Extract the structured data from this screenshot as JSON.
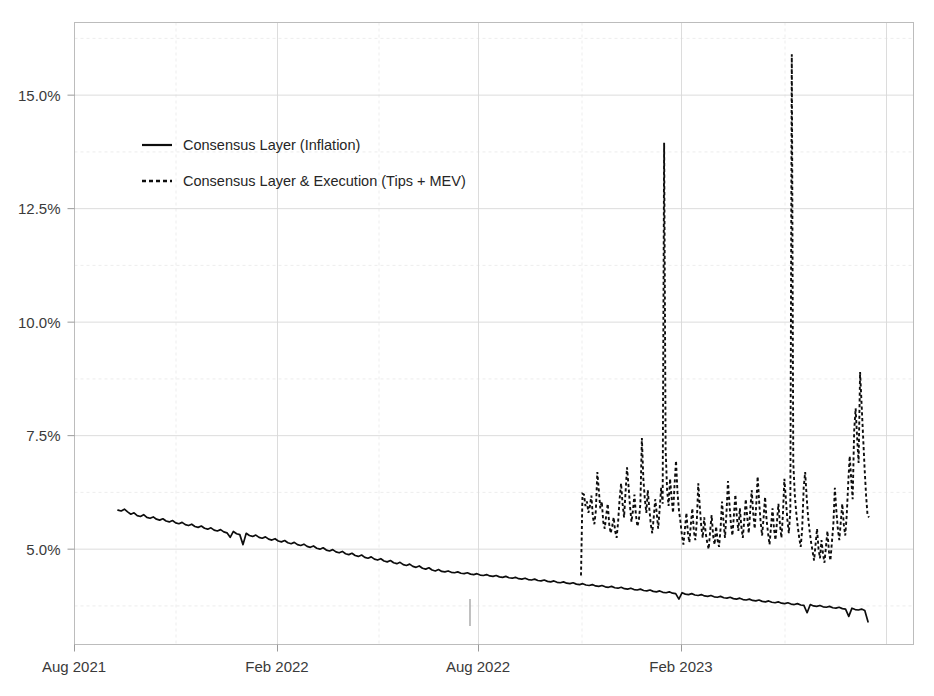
{
  "chart_data": {
    "type": "line",
    "title": "",
    "subtitle": "",
    "xlabel": "",
    "ylabel": "",
    "grid": true,
    "legend_position": "top-left-inside",
    "y_tick_labels": [
      "15.0%",
      "12.5%",
      "10.0%",
      "7.5%",
      "5.0%"
    ],
    "y_tick_values": [
      15.0,
      12.5,
      10.0,
      7.5,
      5.0
    ],
    "ylim": [
      2.9,
      16.6
    ],
    "y_unit": "%",
    "x_tick_labels": [
      "Aug 2021",
      "Feb 2022",
      "Aug 2022",
      "Feb 2023"
    ],
    "x_tick_values": [
      "2021-08",
      "2022-02",
      "2022-08",
      "2023-02"
    ],
    "xlim": [
      "2021-08-01",
      "2023-05-20"
    ],
    "series": [
      {
        "name": "Consensus Layer (Inflation)",
        "style": "solid",
        "color": "#0d0d0d",
        "x_start": "2021-09-01",
        "x_end": "2023-04-25",
        "values": [
          5.86,
          5.84,
          5.88,
          5.82,
          5.77,
          5.8,
          5.74,
          5.72,
          5.76,
          5.7,
          5.68,
          5.71,
          5.66,
          5.64,
          5.67,
          5.62,
          5.6,
          5.63,
          5.58,
          5.56,
          5.59,
          5.54,
          5.52,
          5.55,
          5.5,
          5.48,
          5.51,
          5.46,
          5.44,
          5.47,
          5.42,
          5.4,
          5.43,
          5.38,
          5.36,
          5.26,
          5.39,
          5.34,
          5.32,
          5.1,
          5.35,
          5.3,
          5.28,
          5.31,
          5.26,
          5.24,
          5.27,
          5.22,
          5.2,
          5.23,
          5.18,
          5.16,
          5.19,
          5.14,
          5.12,
          5.15,
          5.1,
          5.08,
          5.11,
          5.06,
          5.04,
          5.07,
          5.02,
          5.0,
          5.03,
          4.98,
          4.96,
          4.99,
          4.94,
          4.92,
          4.95,
          4.9,
          4.88,
          4.91,
          4.86,
          4.84,
          4.87,
          4.82,
          4.8,
          4.83,
          4.78,
          4.76,
          4.79,
          4.74,
          4.72,
          4.75,
          4.7,
          4.68,
          4.71,
          4.66,
          4.64,
          4.67,
          4.62,
          4.6,
          4.63,
          4.58,
          4.56,
          4.59,
          4.54,
          4.52,
          4.55,
          4.51,
          4.5,
          4.52,
          4.49,
          4.48,
          4.5,
          4.47,
          4.46,
          4.48,
          4.45,
          4.44,
          4.46,
          4.43,
          4.42,
          4.44,
          4.41,
          4.4,
          4.42,
          4.39,
          4.38,
          4.4,
          4.37,
          4.36,
          4.38,
          4.35,
          4.34,
          4.36,
          4.33,
          4.32,
          4.34,
          4.31,
          4.3,
          4.32,
          4.29,
          4.28,
          4.3,
          4.27,
          4.26,
          4.28,
          4.25,
          4.24,
          4.26,
          4.23,
          4.22,
          4.24,
          4.21,
          4.2,
          4.22,
          4.19,
          4.18,
          4.2,
          4.17,
          4.16,
          4.18,
          4.15,
          4.14,
          4.16,
          4.13,
          4.12,
          4.14,
          4.11,
          4.1,
          4.12,
          4.09,
          4.08,
          4.1,
          4.07,
          4.06,
          4.08,
          4.05,
          4.04,
          4.06,
          4.03,
          4.02,
          3.9,
          4.04,
          4.01,
          4.0,
          4.02,
          3.99,
          3.98,
          4.0,
          3.97,
          3.96,
          3.98,
          3.95,
          3.94,
          3.96,
          3.93,
          3.92,
          3.94,
          3.91,
          3.9,
          3.92,
          3.89,
          3.88,
          3.9,
          3.87,
          3.86,
          3.88,
          3.85,
          3.84,
          3.86,
          3.83,
          3.82,
          3.84,
          3.81,
          3.8,
          3.82,
          3.79,
          3.78,
          3.8,
          3.77,
          3.76,
          3.6,
          3.78,
          3.75,
          3.74,
          3.76,
          3.73,
          3.72,
          3.74,
          3.71,
          3.7,
          3.72,
          3.69,
          3.68,
          3.52,
          3.7,
          3.67,
          3.66,
          3.68,
          3.65,
          3.4
        ]
      },
      {
        "name": "Consensus Layer & Execution (Tips + MEV)",
        "style": "dashed",
        "color": "#0d0d0d",
        "x_start": "2022-09-15",
        "x_end": "2023-04-26",
        "note": "starts with a vertical jump from the solid series at The Merge",
        "values": [
          4.42,
          6.22,
          6.2,
          5.95,
          6.05,
          5.8,
          5.95,
          6.18,
          5.7,
          5.55,
          5.85,
          6.7,
          6.3,
          5.9,
          6.05,
          5.6,
          5.45,
          5.75,
          6.0,
          5.55,
          5.35,
          5.5,
          5.7,
          5.4,
          5.25,
          5.6,
          6.1,
          6.45,
          6.0,
          5.7,
          6.25,
          6.8,
          6.4,
          5.95,
          5.6,
          5.85,
          6.2,
          5.75,
          5.5,
          5.65,
          6.0,
          7.45,
          6.55,
          6.1,
          5.8,
          6.3,
          5.9,
          5.55,
          5.35,
          5.7,
          6.1,
          5.8,
          5.45,
          5.9,
          6.35,
          6.0,
          13.95,
          7.2,
          6.3,
          5.95,
          6.55,
          6.15,
          5.8,
          6.4,
          6.95,
          6.25,
          5.85,
          5.6,
          5.3,
          5.1,
          5.45,
          5.8,
          5.35,
          5.15,
          5.55,
          5.9,
          5.4,
          5.2,
          5.6,
          6.45,
          5.95,
          5.5,
          5.25,
          5.7,
          5.35,
          5.15,
          5.0,
          5.4,
          5.75,
          5.3,
          5.1,
          5.5,
          5.2,
          5.05,
          5.45,
          6.05,
          5.6,
          5.25,
          5.8,
          6.5,
          6.0,
          5.55,
          5.3,
          5.75,
          6.2,
          5.7,
          5.4,
          5.9,
          5.5,
          5.25,
          5.65,
          6.1,
          5.7,
          5.35,
          5.85,
          6.3,
          5.8,
          5.45,
          5.95,
          6.6,
          6.05,
          5.6,
          5.3,
          5.7,
          6.15,
          5.65,
          5.35,
          5.1,
          5.5,
          5.9,
          5.45,
          5.2,
          5.6,
          6.0,
          5.55,
          5.25,
          5.75,
          6.55,
          6.1,
          5.65,
          5.35,
          5.85,
          15.9,
          6.9,
          6.2,
          5.8,
          5.5,
          5.25,
          5.05,
          5.45,
          6.35,
          6.7,
          6.15,
          5.7,
          5.4,
          5.15,
          4.95,
          4.75,
          5.1,
          5.45,
          5.0,
          4.8,
          5.2,
          4.9,
          4.7,
          5.05,
          5.4,
          4.95,
          4.75,
          5.15,
          5.55,
          6.35,
          5.85,
          5.45,
          5.2,
          5.6,
          6.0,
          5.55,
          5.3,
          5.75,
          6.45,
          7.05,
          6.55,
          6.1,
          7.6,
          8.1,
          7.45,
          6.9,
          8.9,
          8.2,
          7.5,
          6.8,
          6.2,
          5.75,
          5.7
        ]
      }
    ],
    "annotations": [
      {
        "name": "merge-marker",
        "x": "2022-07-25",
        "y_from": 3.35,
        "y_to": 3.9
      }
    ]
  },
  "legend": {
    "items": [
      {
        "label": "Consensus Layer (Inflation)",
        "marker": "solid-line"
      },
      {
        "label": "Consensus Layer & Execution (Tips + MEV)",
        "marker": "dashed-line"
      }
    ]
  },
  "axes": {
    "y_labels": [
      "15.0%",
      "12.5%",
      "10.0%",
      "7.5%",
      "5.0%"
    ],
    "x_labels": [
      "Aug 2021",
      "Feb 2022",
      "Aug 2022",
      "Feb 2023"
    ]
  },
  "colors": {
    "series": "#0d0d0d",
    "grid_major": "#d8d8d8",
    "grid_minor": "#e8e8e8",
    "frame": "#bcbcbc",
    "text": "#3a3a3a",
    "background": "#ffffff"
  }
}
